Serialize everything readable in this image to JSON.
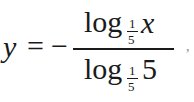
{
  "formula": {
    "latex": "y = -\\frac{\\log_{\\frac{1}{5}} x}{\\log_{\\frac{1}{5}} 5}",
    "lhs": "y",
    "equals": "=",
    "minus": "−",
    "numerator": {
      "func": "log",
      "base": {
        "num": "1",
        "den": "5"
      },
      "arg": "x"
    },
    "denominator": {
      "func": "log",
      "base": {
        "num": "1",
        "den": "5"
      },
      "arg": "5"
    },
    "trailing": ","
  }
}
